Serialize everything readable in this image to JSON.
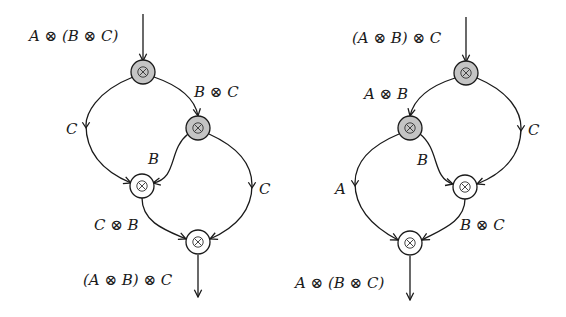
{
  "diagrams": [
    {
      "id": "left",
      "input_label": "A ⊗ (B ⊗ C)",
      "output_label": "(A ⊗ B) ⊗ C",
      "edge_labels": {
        "top_left_C": "C",
        "top_right_BC": "B ⊗ C",
        "inner_B": "B",
        "right_C": "C",
        "bottom_CB": "C ⊗ B"
      },
      "nodes": [
        {
          "name": "split-top",
          "symbol": "⊗",
          "fill": "gray"
        },
        {
          "name": "split-inner",
          "symbol": "⊗",
          "fill": "gray"
        },
        {
          "name": "merge-inner",
          "symbol": "⊗",
          "fill": "white"
        },
        {
          "name": "merge-bottom",
          "symbol": "⊗",
          "fill": "white"
        }
      ]
    },
    {
      "id": "right",
      "input_label": "(A ⊗ B) ⊗ C",
      "output_label": "A ⊗ (B ⊗ C)",
      "edge_labels": {
        "top_left_AB": "A ⊗ B",
        "right_C": "C",
        "inner_B": "B",
        "left_A": "A",
        "bottom_BC": "B ⊗ C"
      },
      "nodes": [
        {
          "name": "split-top",
          "symbol": "⊗",
          "fill": "gray"
        },
        {
          "name": "split-inner",
          "symbol": "⊗",
          "fill": "gray"
        },
        {
          "name": "merge-inner",
          "symbol": "⊗",
          "fill": "white"
        },
        {
          "name": "merge-bottom",
          "symbol": "⊗",
          "fill": "white"
        }
      ]
    }
  ],
  "colors": {
    "gray_node": "#c4c4c4",
    "white_node": "#ffffff",
    "stroke": "#1a1a1a"
  }
}
